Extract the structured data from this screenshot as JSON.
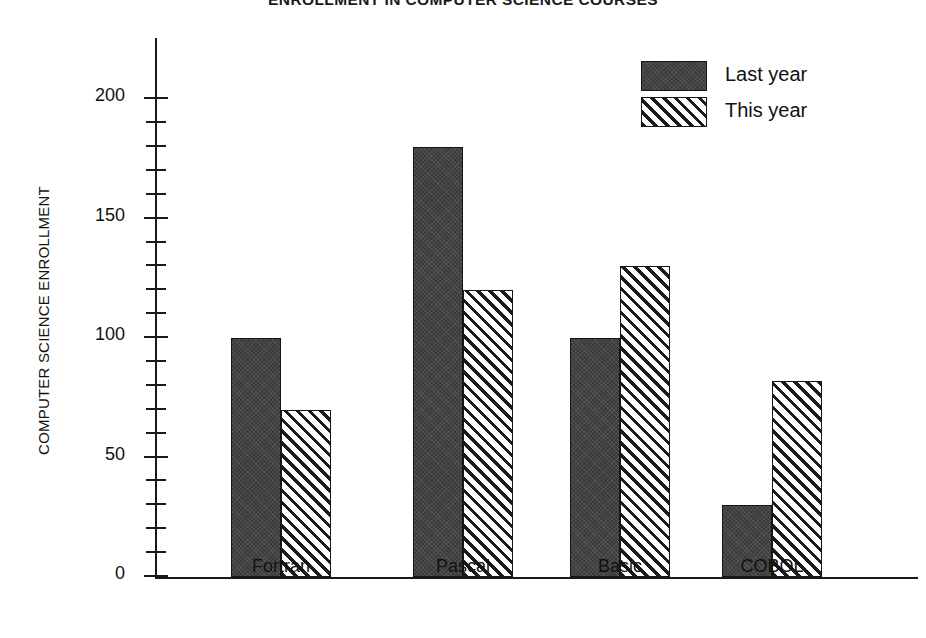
{
  "chart_data": {
    "type": "bar",
    "title": "ENROLLMENT IN COMPUTER SCIENCE COURSES",
    "xlabel": "",
    "ylabel": "COMPUTER SCIENCE ENROLLMENT",
    "categories": [
      "Fortran",
      "Pascal",
      "Basic",
      "COBOL"
    ],
    "series": [
      {
        "name": "Last year",
        "values": [
          100,
          180,
          100,
          30
        ],
        "fill": "solid-dark",
        "color": "#3b3b3b"
      },
      {
        "name": "This year",
        "values": [
          70,
          120,
          130,
          82
        ],
        "fill": "diagonal-hatch",
        "color": "#ffffff"
      }
    ],
    "ylim": [
      0,
      226
    ],
    "y_major_ticks": [
      0,
      50,
      100,
      150,
      200
    ],
    "y_major_tick_labels": [
      "0",
      "50",
      "100",
      "150",
      "200"
    ],
    "y_minor_tick_interval": 10,
    "grid": false,
    "legend_position": "top-right"
  },
  "legend": {
    "entries": [
      {
        "label": "Last year"
      },
      {
        "label": "This year"
      }
    ]
  }
}
